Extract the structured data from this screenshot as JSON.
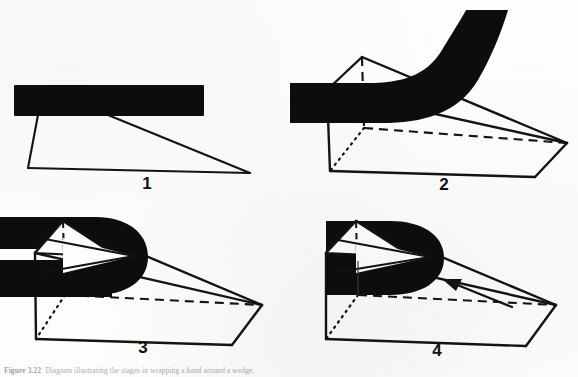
{
  "figure": {
    "caption_label": "Figure 3.22",
    "caption_text": "Diagram illustrating the stages in wrapping a band around a wedge.",
    "ink_color": "#0d0d0d",
    "paper_color": "#fdfdfc"
  },
  "panels": [
    {
      "id": "panel-1",
      "number": "1",
      "description": "Straight black band held above a thin wire-outline triangular wedge seen edge-on."
    },
    {
      "id": "panel-2",
      "number": "2",
      "description": "Black band laid across the wedge with its free end curving upward to the right."
    },
    {
      "id": "panel-3",
      "number": "3",
      "description": "Band bent into an open U hook around the nose of the wedge, white triangular face showing inside."
    },
    {
      "id": "panel-4",
      "number": "4",
      "description": "Band pulled tight around the wedge; an arrow along the wedge indicates the direction of pull."
    }
  ],
  "annotations": {
    "pull_arrow": "arrow-pointing-left"
  }
}
